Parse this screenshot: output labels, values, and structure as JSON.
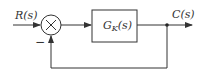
{
  "diagram": {
    "type": "feedback-block-diagram",
    "input_label": "R(s)",
    "output_label": "C(s)",
    "block": {
      "label_main": "G",
      "label_sub": "K",
      "label_arg": "(s)"
    },
    "summing_junction": {
      "symbol": "×",
      "feedback_sign": "−"
    },
    "colors": {
      "stroke": "#333333",
      "background": "#ffffff"
    }
  }
}
